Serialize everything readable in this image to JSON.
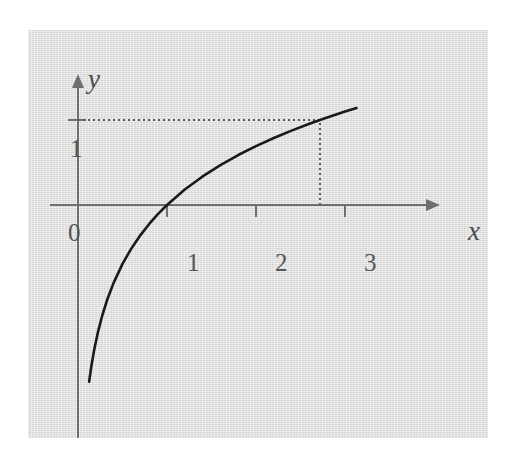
{
  "figure": {
    "name": "natural-logarithm-graph",
    "background_color": "#ffffff",
    "panel_color": "#dedede",
    "curve_color": "#1a1a1a",
    "axis_color": "#6f6f6f",
    "text_color": "#4f4f4f"
  },
  "labels": {
    "y_axis": "y",
    "x_axis": "x"
  },
  "ticks": {
    "y": [
      "1",
      "0"
    ],
    "x": [
      "1",
      "2",
      "3"
    ]
  },
  "chart_data": {
    "type": "line",
    "title": "",
    "subtitle": "",
    "xlabel": "x",
    "ylabel": "y",
    "function": "y = ln x",
    "grid": false,
    "legend": null,
    "xlim": [
      0,
      3.4
    ],
    "ylim": [
      -2.45,
      1.45
    ],
    "xticks": [
      1,
      2,
      3
    ],
    "xtick_labels": [
      "1",
      "2",
      "3"
    ],
    "yticks": [
      0,
      1
    ],
    "ytick_labels": [
      "0",
      "1"
    ],
    "axis_arrows": [
      "x",
      "y"
    ],
    "series": [
      {
        "name": "y = ln x",
        "color": "#1a1a1a",
        "x": [
          0.125,
          0.15,
          0.18,
          0.22,
          0.27,
          0.33,
          0.4,
          0.5,
          0.6,
          0.7,
          0.8,
          0.9,
          1.0,
          1.2,
          1.4,
          1.6,
          1.8,
          2.0,
          2.2,
          2.4,
          2.6,
          2.718,
          2.8,
          3.0,
          3.13
        ],
        "y": [
          -2.079,
          -1.897,
          -1.715,
          -1.514,
          -1.309,
          -1.109,
          -0.916,
          -0.693,
          -0.511,
          -0.357,
          -0.223,
          -0.105,
          0.0,
          0.182,
          0.336,
          0.47,
          0.588,
          0.693,
          0.788,
          0.875,
          0.956,
          1.0,
          1.03,
          1.099,
          1.141
        ]
      }
    ],
    "annotations": [
      {
        "type": "dotted-horizontal-line",
        "name": "y-equals-one-guideline",
        "y": 1,
        "x_from": 0,
        "x_to": 2.718
      },
      {
        "type": "dotted-vertical-line",
        "name": "x-equals-e-guideline",
        "x": 2.718,
        "y_from": 0,
        "y_to": 1
      }
    ]
  }
}
